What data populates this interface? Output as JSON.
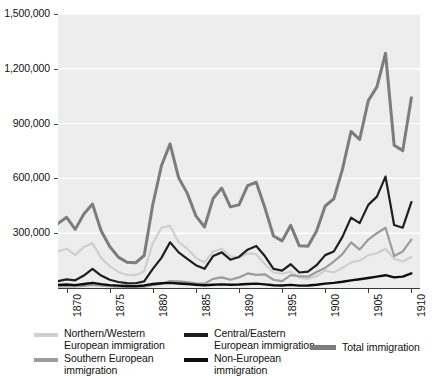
{
  "chart_data": {
    "type": "line",
    "title": "",
    "subtitle": "",
    "xlabel": "",
    "ylabel": "",
    "grid": true,
    "legend_position": "bottom",
    "xlim": [
      1869,
      1911
    ],
    "ylim": [
      0,
      1500000
    ],
    "x_ticks": [
      1870,
      1875,
      1880,
      1885,
      1890,
      1895,
      1900,
      1905,
      1910
    ],
    "x_tick_labels": [
      "1870",
      "1875",
      "1880",
      "1885",
      "1890",
      "1895",
      "1900",
      "1905",
      "1910"
    ],
    "y_ticks": [
      300000,
      600000,
      900000,
      1200000,
      1500000
    ],
    "y_tick_labels": [
      "300,000",
      "600,000",
      "900,000",
      "1,200,000",
      "1,500,000"
    ],
    "x": [
      1869,
      1870,
      1871,
      1872,
      1873,
      1874,
      1875,
      1876,
      1877,
      1878,
      1879,
      1880,
      1881,
      1882,
      1883,
      1884,
      1885,
      1886,
      1887,
      1888,
      1889,
      1890,
      1891,
      1892,
      1893,
      1894,
      1895,
      1896,
      1897,
      1898,
      1899,
      1900,
      1901,
      1902,
      1903,
      1904,
      1905,
      1906,
      1907,
      1908,
      1909,
      1910
    ],
    "series": [
      {
        "name": "Total immigration",
        "color": "#7d7d7d",
        "width": 3.0,
        "values": [
          353000,
          387000,
          321000,
          405000,
          460000,
          313000,
          227000,
          169000,
          141000,
          138000,
          178000,
          457000,
          669000,
          789000,
          603000,
          518000,
          395000,
          334000,
          490000,
          547000,
          444000,
          455000,
          560000,
          579000,
          440000,
          285000,
          258000,
          343000,
          231000,
          229000,
          312000,
          449000,
          488000,
          649000,
          857000,
          813000,
          1026000,
          1101000,
          1285000,
          782000,
          752000,
          1041000
        ]
      },
      {
        "name": "Central/Eastern European immigration",
        "color": "#1f1f1f",
        "width": 2.2,
        "values": [
          38000,
          47000,
          42000,
          68000,
          105000,
          68000,
          45000,
          33000,
          27000,
          26000,
          36000,
          105000,
          165000,
          250000,
          195000,
          160000,
          125000,
          105000,
          175000,
          195000,
          155000,
          170000,
          210000,
          230000,
          175000,
          105000,
          95000,
          130000,
          85000,
          90000,
          125000,
          180000,
          200000,
          280000,
          385000,
          355000,
          455000,
          500000,
          610000,
          345000,
          330000,
          470000
        ]
      },
      {
        "name": "Southern European immigration",
        "color": "#9c9c9c",
        "width": 2.2,
        "values": [
          8000,
          10000,
          9000,
          12000,
          17000,
          13000,
          10000,
          7000,
          6000,
          6000,
          8000,
          15000,
          22000,
          38000,
          36000,
          32000,
          26000,
          24000,
          50000,
          58000,
          45000,
          58000,
          80000,
          72000,
          75000,
          45000,
          38000,
          70000,
          65000,
          62000,
          88000,
          110000,
          145000,
          185000,
          250000,
          210000,
          265000,
          300000,
          330000,
          175000,
          200000,
          265000
        ]
      },
      {
        "name": "Northern/Western European immigration",
        "color": "#cfcfcf",
        "width": 2.2,
        "values": [
          200000,
          215000,
          180000,
          225000,
          245000,
          165000,
          120000,
          88000,
          72000,
          70000,
          92000,
          245000,
          330000,
          340000,
          250000,
          215000,
          165000,
          140000,
          200000,
          215000,
          175000,
          165000,
          190000,
          185000,
          130000,
          85000,
          78000,
          90000,
          55000,
          50000,
          65000,
          95000,
          85000,
          110000,
          140000,
          150000,
          180000,
          190000,
          215000,
          160000,
          145000,
          170000
        ]
      },
      {
        "name": "Non-European immigration",
        "color": "#0d0d0d",
        "width": 2.4,
        "values": [
          17000,
          19000,
          16000,
          22000,
          28000,
          21000,
          16000,
          13000,
          11000,
          10000,
          14000,
          22000,
          26000,
          28000,
          25000,
          22000,
          18000,
          15000,
          18000,
          20000,
          18000,
          19000,
          22000,
          24000,
          20000,
          15000,
          14000,
          17000,
          13000,
          14000,
          18000,
          24000,
          28000,
          34000,
          42000,
          48000,
          55000,
          62000,
          70000,
          58000,
          62000,
          80000
        ]
      }
    ]
  },
  "legend": {
    "entries": [
      {
        "label": "Northern/Western\nEuropean immigration",
        "color": "#cfcfcf",
        "series": "Northern/Western European immigration"
      },
      {
        "label": "Southern European\nimmigration",
        "color": "#9c9c9c",
        "series": "Southern European immigration"
      },
      {
        "label": "Central/Eastern\nEuropean immigration",
        "color": "#1f1f1f",
        "series": "Central/Eastern European immigration"
      },
      {
        "label": "Non-European\nimmigration",
        "color": "#0d0d0d",
        "series": "Non-European immigration"
      },
      {
        "label": "Total immigration",
        "color": "#7d7d7d",
        "series": "Total immigration"
      }
    ]
  },
  "colors": {
    "panel_background": "#ededed",
    "page_background": "#ffffff",
    "gridline": "#ffffff",
    "axis": "#3a3a3a",
    "text": "#111111"
  }
}
